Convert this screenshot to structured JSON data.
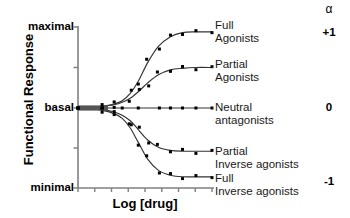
{
  "chart_data": {
    "type": "line",
    "title": "",
    "xlabel": "Log [drug]",
    "ylabel": "Functional Response",
    "grid": false,
    "legend_position": "right-inline",
    "y_tick_labels": [
      "maximal",
      "basal",
      "minimal"
    ],
    "y_tick_values": [
      1,
      0,
      -1
    ],
    "ylim": [
      -1,
      1
    ],
    "x_tick_count": 8,
    "x_tick_labels": [],
    "axis_color": "#808080",
    "curve_color": "#333333",
    "point_color": "#000000",
    "series": [
      {
        "name": "Full Agonists",
        "label_lines": [
          "Full",
          "Agonists"
        ],
        "alpha": "+1",
        "plateau": 0.94,
        "x": [
          0.0,
          0.09,
          0.18,
          0.27,
          0.33,
          0.39,
          0.45,
          0.52,
          0.6,
          0.69,
          0.78,
          0.88,
          1.0
        ],
        "y": [
          0.0,
          0.01,
          0.02,
          0.05,
          0.09,
          0.18,
          0.33,
          0.56,
          0.76,
          0.88,
          0.93,
          0.94,
          0.94
        ]
      },
      {
        "name": "Partial Agonists",
        "label_lines": [
          "Partial",
          "Agonists"
        ],
        "alpha": "",
        "plateau": 0.5,
        "x": [
          0.0,
          0.09,
          0.18,
          0.27,
          0.33,
          0.39,
          0.45,
          0.52,
          0.6,
          0.69,
          0.78,
          0.88,
          1.0
        ],
        "y": [
          0.0,
          0.01,
          0.02,
          0.04,
          0.07,
          0.12,
          0.2,
          0.31,
          0.41,
          0.47,
          0.49,
          0.5,
          0.5
        ]
      },
      {
        "name": "Neutral antagonists",
        "label_lines": [
          "Neutral",
          "antagonists"
        ],
        "alpha": "0",
        "plateau": 0.0,
        "x": [
          0.0,
          0.09,
          0.18,
          0.27,
          0.33,
          0.39,
          0.45,
          0.52,
          0.6,
          0.69,
          0.78,
          0.88,
          1.0
        ],
        "y": [
          0.0,
          0.0,
          0.0,
          0.0,
          0.0,
          0.0,
          0.0,
          0.0,
          0.0,
          0.0,
          0.0,
          0.0,
          0.0
        ]
      },
      {
        "name": "Partial Inverse agonists",
        "label_lines": [
          "Partial",
          "Inverse agonists"
        ],
        "alpha": "",
        "plateau": -0.54,
        "x": [
          0.0,
          0.09,
          0.18,
          0.27,
          0.33,
          0.39,
          0.45,
          0.52,
          0.6,
          0.69,
          0.78,
          0.88,
          1.0
        ],
        "y": [
          0.0,
          -0.01,
          -0.02,
          -0.05,
          -0.09,
          -0.16,
          -0.27,
          -0.4,
          -0.49,
          -0.53,
          -0.54,
          -0.54,
          -0.54
        ]
      },
      {
        "name": "Full Inverse agonists",
        "label_lines": [
          "Full",
          "Inverse agonists"
        ],
        "alpha": "-1",
        "plateau": -0.86,
        "x": [
          0.0,
          0.09,
          0.18,
          0.27,
          0.33,
          0.39,
          0.45,
          0.52,
          0.6,
          0.69,
          0.78,
          0.88,
          1.0
        ],
        "y": [
          0.0,
          -0.01,
          -0.03,
          -0.07,
          -0.13,
          -0.25,
          -0.43,
          -0.64,
          -0.78,
          -0.84,
          -0.86,
          -0.86,
          -0.86
        ]
      }
    ],
    "alpha_column": {
      "header": "α",
      "values": [
        "+1",
        "0",
        "-1"
      ]
    }
  },
  "axes": {
    "y_title": "Functional Response",
    "x_title": "Log [drug]",
    "y_labels": {
      "top": "maximal",
      "middle": "basal",
      "bottom": "minimal"
    }
  },
  "labels": {
    "full_agonists_l1": "Full",
    "full_agonists_l2": "Agonists",
    "partial_agonists_l1": "Partial",
    "partial_agonists_l2": "Agonists",
    "neutral_l1": "Neutral",
    "neutral_l2": "antagonists",
    "partial_inverse_l1": "Partial",
    "partial_inverse_l2": "Inverse agonists",
    "full_inverse_l1": "Full",
    "full_inverse_l2": "Inverse agonists"
  },
  "alpha": {
    "header": "α",
    "plus_one": "+1",
    "zero": "0",
    "minus_one": "-1"
  }
}
